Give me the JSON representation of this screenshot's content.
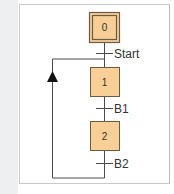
{
  "diagram": {
    "type": "grafcet-sequential-function-chart",
    "colors": {
      "step_fill": "#f8cf96",
      "step_border": "#6b5a44",
      "line": "#4a4a4a",
      "frame_border": "#c9c9c9",
      "left_strip": "#eeeff1"
    },
    "steps": [
      {
        "id": "0",
        "label": "0",
        "initial": true
      },
      {
        "id": "1",
        "label": "1",
        "initial": false
      },
      {
        "id": "2",
        "label": "2",
        "initial": false
      }
    ],
    "transitions": [
      {
        "label": "Start",
        "from": "0",
        "to": "1"
      },
      {
        "label": "B1",
        "from": "1",
        "to": "2"
      },
      {
        "label": "B2",
        "from": "2",
        "to": "1",
        "loop": true
      }
    ],
    "loop_arrow": "up-arrow"
  }
}
